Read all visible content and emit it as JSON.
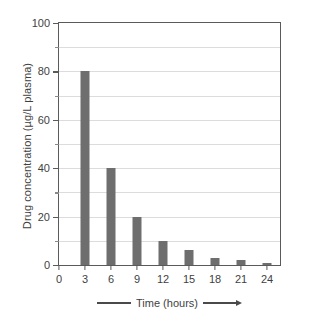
{
  "chart_data": {
    "type": "bar",
    "title": "",
    "subtitle": "",
    "xlabel": "Time (hours)",
    "ylabel": "Drug concentration (µg/L plasma)",
    "categories": [
      "0",
      "3",
      "6",
      "9",
      "12",
      "15",
      "18",
      "21",
      "24"
    ],
    "x": [
      0,
      3,
      6,
      9,
      12,
      15,
      18,
      21,
      24
    ],
    "values": [
      0,
      80,
      40,
      20,
      10,
      6,
      3,
      2,
      1
    ],
    "series": [
      {
        "name": "Drug concentration",
        "values": [
          0,
          80,
          40,
          20,
          10,
          6,
          3,
          2,
          1
        ],
        "color": "#6e6e6e"
      }
    ],
    "xlim": [
      0,
      25.5
    ],
    "ylim": [
      0,
      100
    ],
    "ytick_labels": [
      "0",
      "20",
      "40",
      "60",
      "80",
      "100"
    ],
    "ytick_values": [
      0,
      20,
      40,
      60,
      80,
      100
    ],
    "yminor_values": [
      10,
      30,
      50,
      70,
      90
    ],
    "xtick_labels": [
      "0",
      "3",
      "6",
      "9",
      "12",
      "15",
      "18",
      "21",
      "24"
    ],
    "xtick_values": [
      0,
      3,
      6,
      9,
      12,
      15,
      18,
      21,
      24
    ],
    "gridlines": "horizontal",
    "grid_values": [
      10,
      20,
      30,
      40,
      50,
      60,
      70,
      80,
      90
    ],
    "legend": "none",
    "annotations": [
      "arrow pointing right along x-axis title"
    ]
  },
  "axes": {
    "y_title": "Drug concentration (µg/L plasma)",
    "x_title": "Time (hours)"
  },
  "colors": {
    "bar": "#6e6e6e",
    "frame": "#5a5a5a",
    "grid": "#dcdcdc",
    "text": "#3f3f3f",
    "background": "#ffffff"
  }
}
